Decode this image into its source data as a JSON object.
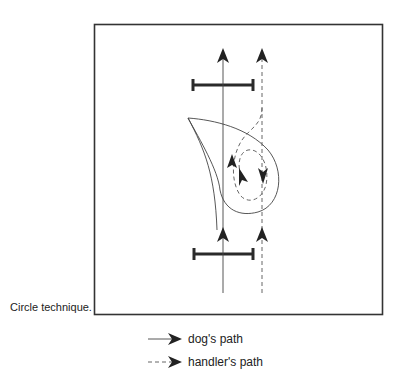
{
  "figure": {
    "caption": "Circle technique.",
    "elements": {
      "jumps": [
        {
          "name": "top-jump",
          "x1": 193,
          "x2": 253,
          "y": 85
        },
        {
          "name": "bottom-jump",
          "x1": 194,
          "x2": 253,
          "y": 254
        }
      ],
      "dog_path": "solid line",
      "handler_path": "dashed line"
    }
  },
  "legend": {
    "items": [
      {
        "label": "dog's path",
        "style": "solid"
      },
      {
        "label": "handler's path",
        "style": "dashed"
      }
    ]
  },
  "colors": {
    "stroke": "#333333",
    "jump": "#2a2a2a",
    "background": "#ffffff"
  }
}
